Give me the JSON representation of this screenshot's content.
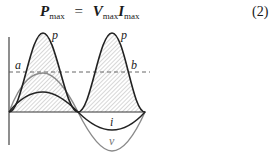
{
  "equation": {
    "lhs_symbol": "P",
    "lhs_sub": "max",
    "equals": "=",
    "rhs1_symbol": "V",
    "rhs1_sub": "max",
    "rhs2_symbol": "I",
    "rhs2_sub": "max",
    "number": "(2)"
  },
  "figure": {
    "labels": {
      "p_first": "p",
      "p_second": "p",
      "a": "a",
      "b": "b",
      "i": "i",
      "v": "v"
    },
    "colors": {
      "power_curve": "#222222",
      "current_curve": "#222222",
      "voltage_curve": "#8a8a8a",
      "hatch": "#9a9a9a",
      "axis": "#444444"
    }
  }
}
